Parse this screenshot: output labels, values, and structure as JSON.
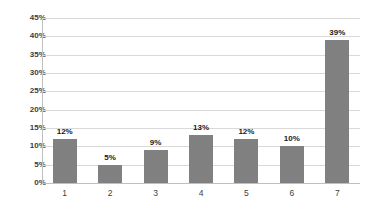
{
  "chart_data": {
    "type": "bar",
    "title": "",
    "subtitle": "",
    "xlabel": "",
    "ylabel": "",
    "categories": [
      "1",
      "2",
      "3",
      "4",
      "5",
      "6",
      "7"
    ],
    "values": [
      12,
      5,
      9,
      13,
      12,
      10,
      39
    ],
    "data_labels": [
      "12%",
      "5%",
      "9%",
      "13%",
      "12%",
      "10%",
      "39%"
    ],
    "ylim": [
      0,
      45
    ],
    "ytick_values": [
      0,
      5,
      10,
      15,
      20,
      25,
      30,
      35,
      40,
      45
    ],
    "ytick_labels": [
      "0%",
      "5%",
      "10%",
      "15%",
      "20%",
      "25%",
      "30%",
      "35%",
      "40%",
      "45%"
    ],
    "grid": true,
    "grid_axis": "y",
    "legend": false,
    "legend_position": "none",
    "series": [
      {
        "name": "",
        "values": [
          12,
          5,
          9,
          13,
          12,
          10,
          39
        ]
      }
    ],
    "colors": {
      "bar_fill": "#808080",
      "gridline": "#d9d9d9",
      "axis_line": "#bfbfbf",
      "tick_label": "#3c3c3c",
      "data_label": "#1a1a1a",
      "background": "#ffffff"
    }
  }
}
